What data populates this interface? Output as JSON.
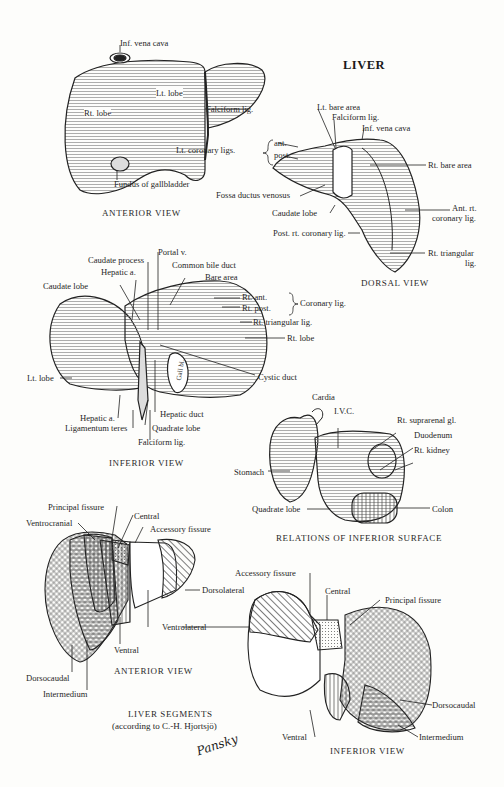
{
  "title": "LIVER",
  "anterior_view": {
    "caption": "ANTERIOR VIEW",
    "labels": {
      "ivc": "Inf. vena cava",
      "lt_lobe": "Lt. lobe",
      "rt_lobe": "Rt. lobe",
      "falciform": "Falciform lig.",
      "fundus": "Fundus of gallbladder"
    }
  },
  "dorsal_view": {
    "caption": "DORSAL VIEW",
    "labels": {
      "lt_bare_area": "Lt. bare area",
      "falciform": "Falciform lig.",
      "ivc": "Inf. vena cava",
      "lt_coronary": "Lt. coronary ligs.",
      "ant": "ant.",
      "post": "post.",
      "rt_bare_area": "Rt. bare area",
      "fossa": "Fossa ductus venosus",
      "ant_rt_coronary_1": "Ant. rt.",
      "ant_rt_coronary_2": "coronary lig.",
      "caudate_lobe": "Caudate lobe",
      "post_rt_coronary": "Post. rt. coronary lig.",
      "rt_triangular_1": "Rt. triangular",
      "rt_triangular_2": "lig."
    }
  },
  "inferior_view": {
    "caption": "INFERIOR VIEW",
    "labels": {
      "portal_v": "Portal v.",
      "caudate_process": "Caudate process",
      "common_bile_duct": "Common bile duct",
      "hepatic_a_top": "Hepatic a.",
      "bare_area": "Bare area",
      "caudate_lobe": "Caudate lobe",
      "rt_ant": "Rt. ant.",
      "rt_post": "Rt. post.",
      "coronary_lig": "Coronary lig.",
      "rt_triangular": "Rt. triangular lig.",
      "rt_lobe": "Rt. lobe",
      "lt_lobe": "Lt. lobe",
      "cystic_duct": "Cystic duct",
      "gall_bl": "Gall bl.",
      "hepatic_a_bottom": "Hepatic a.",
      "hepatic_duct": "Hepatic duct",
      "ligamentum_teres": "Ligamentum teres",
      "quadrate_lobe": "Quadrate lobe",
      "falciform": "Falciform lig."
    }
  },
  "relations_view": {
    "caption": "RELATIONS OF INFERIOR SURFACE",
    "labels": {
      "cardia": "Cardia",
      "ivc": "I.V.C.",
      "rt_suprarenal": "Rt. suprarenal gl.",
      "duodenum": "Duodenum",
      "rt_kidney": "Rt. kidney",
      "stomach": "Stomach",
      "quadrate_lobe": "Quadrate lobe",
      "colon": "Colon"
    }
  },
  "segments_anterior": {
    "caption": "ANTERIOR VIEW",
    "labels": {
      "principal_fissure": "Principal fissure",
      "central": "Central",
      "ventrocranial": "Ventrocranial",
      "accessory_fissure": "Accessory fissure",
      "dorsolateral": "Dorsolateral",
      "ventrolateral": "Ventrolateral",
      "ventral": "Ventral",
      "dorsocaudal": "Dorsocaudal",
      "intermedium": "Intermedium"
    }
  },
  "segments_inferior": {
    "caption": "INFERIOR VIEW",
    "labels": {
      "accessory_fissure": "Accessory fissure",
      "central": "Central",
      "principal_fissure": "Principal fissure",
      "dorsocaudal": "Dorsocaudal",
      "ventral": "Ventral",
      "intermedium": "Intermedium"
    }
  },
  "segments_title": {
    "line1": "LIVER SEGMENTS",
    "line2": "(according to C.-H. Hjortsjö)"
  },
  "signature": "Pansky",
  "colors": {
    "ink": "#222222",
    "paper": "#fdfdfb",
    "shade": "#9a9a9a"
  }
}
